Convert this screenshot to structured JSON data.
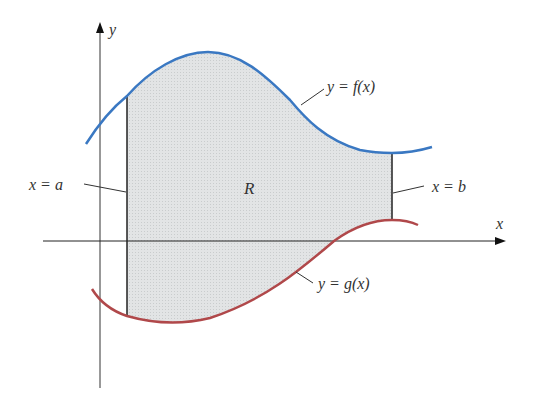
{
  "figure": {
    "labels": {
      "y_axis": "y",
      "x_axis": "x",
      "upper_curve": "y = f(x)",
      "lower_curve": "y = g(x)",
      "left_bound": "x = a",
      "right_bound": "x = b",
      "region": "R"
    },
    "colors": {
      "upper_curve": "#3a78c2",
      "lower_curve": "#b0484a",
      "region_fill": "#dcdedf",
      "axes": "#222222",
      "bounds": "#222222"
    }
  }
}
